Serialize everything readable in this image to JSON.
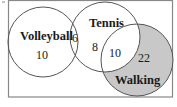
{
  "diagram": {
    "type": "venn",
    "colors": {
      "border": "#888888",
      "circle_stroke": "#555555",
      "shaded_fill": "#c8c8c8",
      "background": "#ffffff",
      "text": "#1a1a1a"
    },
    "sets": {
      "volleyball": {
        "label": "Volleyball"
      },
      "tennis": {
        "label": "Tennis"
      },
      "walking": {
        "label": "Walking",
        "shaded": true
      }
    },
    "regions": {
      "volleyball_only": "10",
      "volleyball_tennis": "6",
      "tennis_only": "8",
      "tennis_walking": "10",
      "walking_only": "22"
    }
  }
}
